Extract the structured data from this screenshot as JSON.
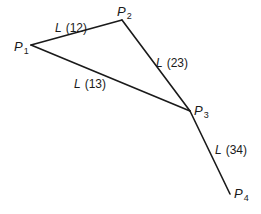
{
  "diagram": {
    "points": [
      {
        "id": "P1",
        "letter": "P",
        "sub": "1",
        "x": 31,
        "y": 45
      },
      {
        "id": "P2",
        "letter": "P",
        "sub": "2",
        "x": 122,
        "y": 20
      },
      {
        "id": "P3",
        "letter": "P",
        "sub": "3",
        "x": 190,
        "y": 111
      },
      {
        "id": "P4",
        "letter": "P",
        "sub": "4",
        "x": 230,
        "y": 194
      }
    ],
    "segments": [
      {
        "from": "P1",
        "to": "P2",
        "letter": "L",
        "index": "(12)"
      },
      {
        "from": "P1",
        "to": "P3",
        "letter": "L",
        "index": "(13)"
      },
      {
        "from": "P2",
        "to": "P3",
        "letter": "L",
        "index": "(23)"
      },
      {
        "from": "P3",
        "to": "P4",
        "letter": "L",
        "index": "(34)"
      }
    ],
    "line_color": "#1a1a1a"
  }
}
